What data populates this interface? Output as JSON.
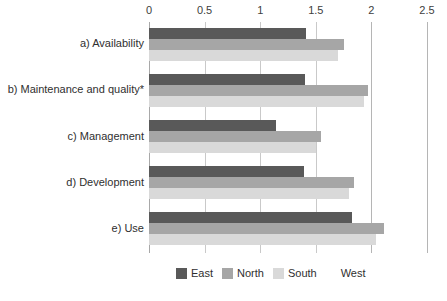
{
  "chart_data": {
    "type": "bar",
    "orientation": "horizontal",
    "title": "",
    "xlabel": "",
    "ylabel": "",
    "xlim": [
      0,
      2.5
    ],
    "xticks": [
      "0",
      "0.5",
      "1",
      "1.5",
      "2",
      "2.5"
    ],
    "xtick_values": [
      0,
      0.5,
      1,
      1.5,
      2,
      2.5
    ],
    "grid": true,
    "legend_position": "bottom",
    "categories": [
      "a) Availability",
      "b) Maintenance and quality*",
      "c) Management",
      "d) Development",
      "e) Use"
    ],
    "series": [
      {
        "name": "East",
        "color": "#595959",
        "values": [
          1.41,
          1.4,
          1.14,
          1.39,
          1.83
        ]
      },
      {
        "name": "North",
        "color": "#a6a6a6",
        "values": [
          1.75,
          1.97,
          1.55,
          1.84,
          2.11
        ]
      },
      {
        "name": "South",
        "color": "#d9d9d9",
        "values": [
          1.7,
          1.93,
          1.5,
          1.8,
          2.04
        ]
      },
      {
        "name": "West",
        "color": "#ffffff",
        "values": [
          0,
          0,
          0,
          0,
          0
        ]
      }
    ]
  },
  "legend": {
    "entries": [
      {
        "label": "East",
        "color": "#595959"
      },
      {
        "label": "North",
        "color": "#a6a6a6"
      },
      {
        "label": "South",
        "color": "#d9d9d9"
      },
      {
        "label": "West",
        "color": "#ffffff"
      }
    ]
  },
  "axis": {
    "ticks": [
      {
        "label": "0",
        "value": 0
      },
      {
        "label": "0.5",
        "value": 0.5
      },
      {
        "label": "1",
        "value": 1
      },
      {
        "label": "1.5",
        "value": 1.5
      },
      {
        "label": "2",
        "value": 2
      },
      {
        "label": "2.5",
        "value": 2.5
      }
    ]
  }
}
